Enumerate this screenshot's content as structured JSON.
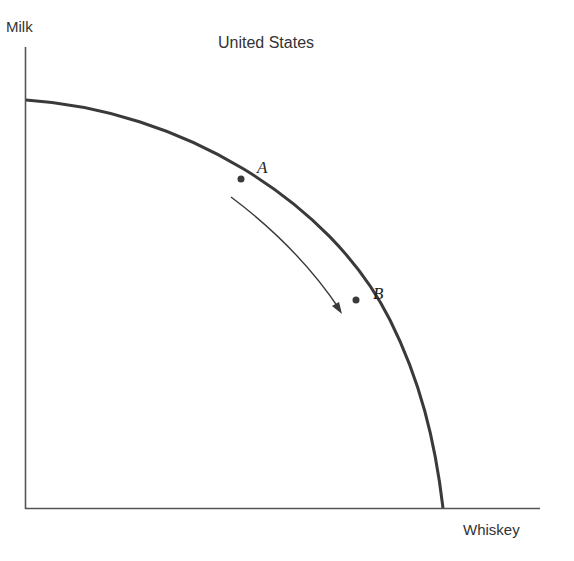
{
  "diagram": {
    "title": "United States",
    "y_axis_label": "Milk",
    "x_axis_label": "Whiskey",
    "curve": "production possibilities frontier",
    "points": [
      {
        "label": "A"
      },
      {
        "label": "B"
      }
    ],
    "arrow": "movement from A toward B along the frontier",
    "colors": {
      "line": "#3a3a3a",
      "text": "#333333",
      "background": "#ffffff"
    }
  }
}
